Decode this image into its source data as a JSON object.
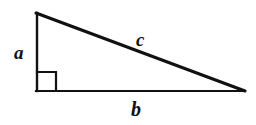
{
  "figure": {
    "background_color": "#ffffff",
    "stroke_color": "#111111",
    "geometry": {
      "top_vertex": [
        36,
        13
      ],
      "right_angle_vertex": [
        36,
        91
      ],
      "far_vertex": [
        245,
        91
      ],
      "right_angle_marker_size": 20,
      "leg_stroke_width": 2,
      "base_stroke_width": 2,
      "hypotenuse_stroke_width": 3
    },
    "labels": {
      "vertical_leg": "a",
      "horizontal_leg": "b",
      "hypotenuse": "c"
    },
    "right_angle_marker": "right-angle-square"
  }
}
